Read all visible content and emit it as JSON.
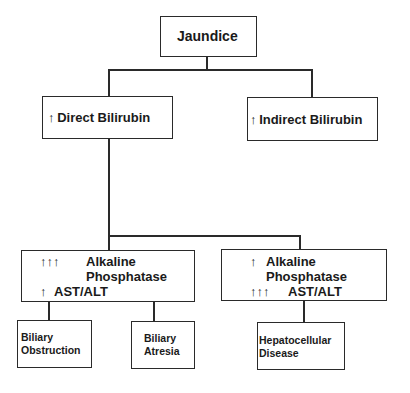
{
  "diagram": {
    "type": "flowchart",
    "root": {
      "label": "Jaundice"
    },
    "level1": [
      {
        "arrow": "↑",
        "label": "Direct Bilirubin"
      },
      {
        "arrow": "↑",
        "label": "Indirect Bilirubin"
      }
    ],
    "level2": [
      {
        "line1_arrow": "↑↑↑",
        "line1": "Alkaline",
        "line2": "Phosphatase",
        "line3_arrow": "↑",
        "line3": "AST/ALT"
      },
      {
        "line1_arrow": "↑",
        "line1": "Alkaline",
        "line2": "Phosphatase",
        "line3_arrow": "↑↑↑",
        "line3": "AST/ALT"
      }
    ],
    "level3": [
      {
        "line1": "Biliary",
        "line2": "Obstruction"
      },
      {
        "line1": "Biliary",
        "line2": "Atresia"
      },
      {
        "line1": "Hepatocellular",
        "line2": "Disease"
      }
    ],
    "colors": {
      "stroke": "#2a2a2a",
      "text": "#1a1a1a",
      "background": "#ffffff"
    }
  }
}
